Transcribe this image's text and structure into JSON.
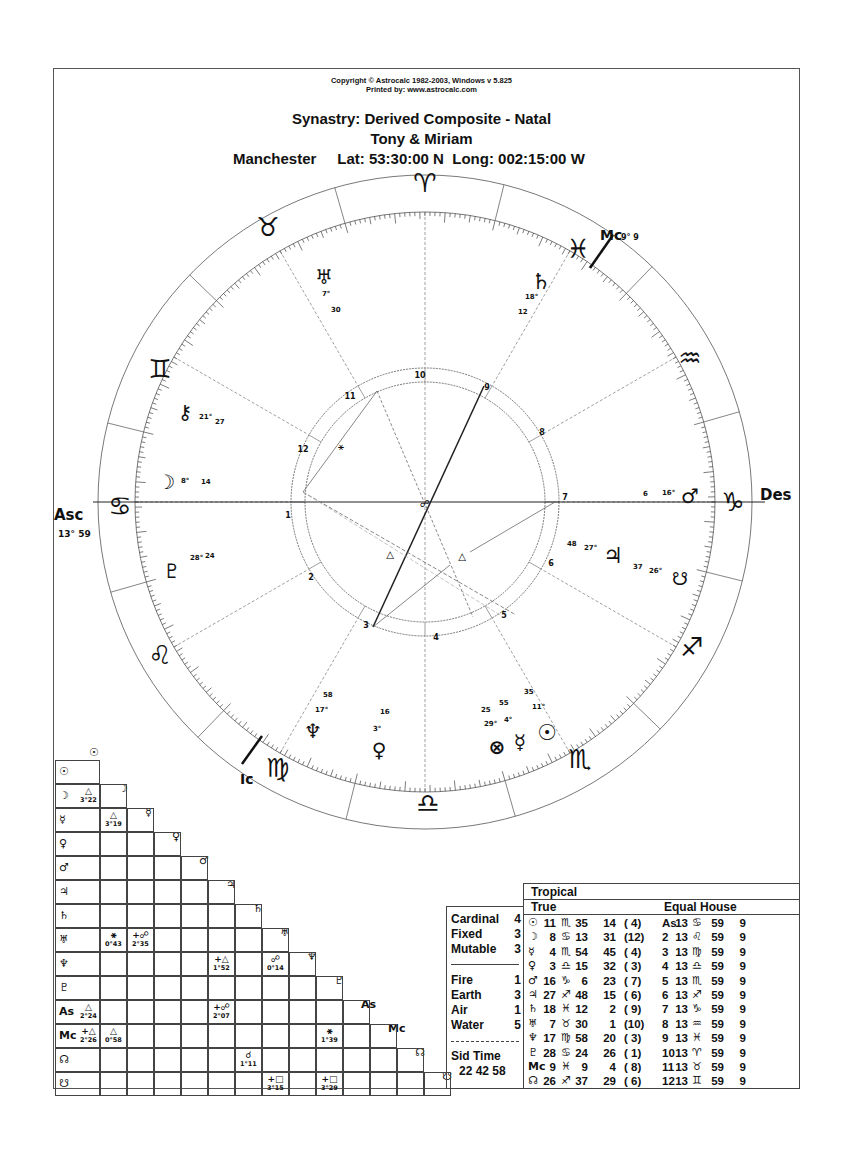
{
  "header": {
    "copyright": "Copyright © Astrocalc 1982-2003, Windows v 5.825",
    "printed_by": "Printed by: www.astrocalc.com",
    "title": "Synastry: Derived Composite - Natal",
    "names": "Tony & Miriam",
    "place": "Manchester",
    "coords": "Lat: 53:30:00 N  Long: 002:15:00 W"
  },
  "wheel": {
    "angles": {
      "asc_label": "Asc",
      "asc_degree": "13° 59",
      "des_label": "Des",
      "mc_label": "Mc",
      "mc_degree": "9° 9",
      "ic_label": "Ic"
    },
    "signs": [
      {
        "name": "Aries",
        "glyph": "♈"
      },
      {
        "name": "Taurus",
        "glyph": "♉"
      },
      {
        "name": "Gemini",
        "glyph": "♊"
      },
      {
        "name": "Cancer",
        "glyph": "♋"
      },
      {
        "name": "Leo",
        "glyph": "♌"
      },
      {
        "name": "Virgo",
        "glyph": "♍"
      },
      {
        "name": "Libra",
        "glyph": "♎"
      },
      {
        "name": "Scorpio",
        "glyph": "♏"
      },
      {
        "name": "Sagittarius",
        "glyph": "♐"
      },
      {
        "name": "Capricorn",
        "glyph": "♑"
      },
      {
        "name": "Aquarius",
        "glyph": "♒"
      },
      {
        "name": "Pisces",
        "glyph": "♓"
      }
    ],
    "house_numbers": [
      "1",
      "2",
      "3",
      "4",
      "5",
      "6",
      "7",
      "8",
      "9",
      "10",
      "11",
      "12"
    ],
    "planets": [
      {
        "name": "Uranus",
        "glyph": "♅",
        "deg": "7°",
        "min": "30"
      },
      {
        "name": "Saturn",
        "glyph": "♄",
        "deg": "18°",
        "min": "12"
      },
      {
        "name": "Chiron",
        "glyph": "⚷",
        "deg": "21°",
        "min": "27"
      },
      {
        "name": "Moon",
        "glyph": "☽",
        "deg": "8°",
        "min": "14"
      },
      {
        "name": "Pluto",
        "glyph": "♇",
        "deg": "28°",
        "min": "24"
      },
      {
        "name": "Mars",
        "glyph": "♂",
        "deg": "16°",
        "min": "6"
      },
      {
        "name": "Jupiter",
        "glyph": "♃",
        "deg": "27°",
        "min": "48"
      },
      {
        "name": "South Node",
        "glyph": "☋",
        "deg": "26°",
        "min": "37"
      },
      {
        "name": "Neptune",
        "glyph": "♆",
        "deg": "17°",
        "min": "58"
      },
      {
        "name": "Venus",
        "glyph": "♀",
        "deg": "3°",
        "min": "16"
      },
      {
        "name": "Part of Fortune",
        "glyph": "⊗",
        "deg": "29°",
        "min": "25"
      },
      {
        "name": "Mercury",
        "glyph": "☿",
        "deg": "4°",
        "min": "55"
      },
      {
        "name": "Sun",
        "glyph": "☉",
        "deg": "11°",
        "min": "35"
      }
    ],
    "aspect_glyphs": {
      "sextile": "⚹",
      "trine": "△",
      "opposition": "☍"
    }
  },
  "aspect_grid": {
    "labels": [
      "☉",
      "☽",
      "☿",
      "♀",
      "♂",
      "♃",
      "♄",
      "♅",
      "♆",
      "♇",
      "As",
      "Mc",
      "☊",
      "☋"
    ],
    "cells": [
      {
        "row": 1,
        "col": 0,
        "glyph": "△",
        "orb": "3°22"
      },
      {
        "row": 2,
        "col": 1,
        "glyph": "△",
        "orb": "3°19"
      },
      {
        "row": 7,
        "col": 1,
        "glyph": "⚹",
        "orb": "0°43"
      },
      {
        "row": 7,
        "col": 2,
        "glyph": "+☍",
        "orb": "2°35"
      },
      {
        "row": 8,
        "col": 5,
        "glyph": "+△",
        "orb": "1°52"
      },
      {
        "row": 8,
        "col": 7,
        "glyph": "☍",
        "orb": "0°14"
      },
      {
        "row": 10,
        "col": 0,
        "glyph": "△",
        "orb": "2°24"
      },
      {
        "row": 10,
        "col": 5,
        "glyph": "+☍",
        "orb": "2°07"
      },
      {
        "row": 11,
        "col": 0,
        "glyph": "+△",
        "orb": "2°26"
      },
      {
        "row": 11,
        "col": 1,
        "glyph": "△",
        "orb": "0°58"
      },
      {
        "row": 11,
        "col": 9,
        "glyph": "⚹",
        "orb": "1°39"
      },
      {
        "row": 12,
        "col": 6,
        "glyph": "☌",
        "orb": "1°11"
      },
      {
        "row": 13,
        "col": 7,
        "glyph": "+□",
        "orb": "3°15"
      },
      {
        "row": 13,
        "col": 9,
        "glyph": "+□",
        "orb": "3°29"
      }
    ]
  },
  "qualities": {
    "modes": [
      {
        "label": "Cardinal",
        "value": "4"
      },
      {
        "label": "Fixed",
        "value": "3"
      },
      {
        "label": "Mutable",
        "value": "3"
      }
    ],
    "elements": [
      {
        "label": "Fire",
        "value": "1"
      },
      {
        "label": "Earth",
        "value": "3"
      },
      {
        "label": "Air",
        "value": "1"
      },
      {
        "label": "Water",
        "value": "5"
      }
    ],
    "sid_time_label": "Sid Time",
    "sid_time_value": "22 42 58"
  },
  "positions": {
    "zodiac": "Tropical",
    "node_type": "True",
    "house_system": "Equal House",
    "rows": [
      {
        "planet": "☉",
        "deg": "11",
        "sign": "♏",
        "min": "35",
        "sec": "14",
        "house": "( 4)",
        "cusp": "As",
        "cdeg": "13",
        "csign": "♋",
        "cmin": "59",
        "csec": "9"
      },
      {
        "planet": "☽",
        "deg": "8",
        "sign": "♋",
        "min": "13",
        "sec": "31",
        "house": "(12)",
        "cusp": "2",
        "cdeg": "13",
        "csign": "♌",
        "cmin": "59",
        "csec": "9"
      },
      {
        "planet": "☿",
        "deg": "4",
        "sign": "♏",
        "min": "54",
        "sec": "45",
        "house": "( 4)",
        "cusp": "3",
        "cdeg": "13",
        "csign": "♍",
        "cmin": "59",
        "csec": "9"
      },
      {
        "planet": "♀",
        "deg": "3",
        "sign": "♎",
        "min": "15",
        "sec": "32",
        "house": "( 3)",
        "cusp": "4",
        "cdeg": "13",
        "csign": "♎",
        "cmin": "59",
        "csec": "9"
      },
      {
        "planet": "♂",
        "deg": "16",
        "sign": "♑",
        "min": "6",
        "sec": "23",
        "house": "( 7)",
        "cusp": "5",
        "cdeg": "13",
        "csign": "♏",
        "cmin": "59",
        "csec": "9"
      },
      {
        "planet": "♃",
        "deg": "27",
        "sign": "♐",
        "min": "48",
        "sec": "15",
        "house": "( 6)",
        "cusp": "6",
        "cdeg": "13",
        "csign": "♐",
        "cmin": "59",
        "csec": "9"
      },
      {
        "planet": "♄",
        "deg": "18",
        "sign": "♓",
        "min": "12",
        "sec": "2",
        "house": "( 9)",
        "cusp": "7",
        "cdeg": "13",
        "csign": "♑",
        "cmin": "59",
        "csec": "9"
      },
      {
        "planet": "♅",
        "deg": "7",
        "sign": "♉",
        "min": "30",
        "sec": "1",
        "house": "(10)",
        "cusp": "8",
        "cdeg": "13",
        "csign": "♒",
        "cmin": "59",
        "csec": "9"
      },
      {
        "planet": "♆",
        "deg": "17",
        "sign": "♍",
        "min": "58",
        "sec": "20",
        "house": "( 3)",
        "cusp": "9",
        "cdeg": "13",
        "csign": "♓",
        "cmin": "59",
        "csec": "9"
      },
      {
        "planet": "♇",
        "deg": "28",
        "sign": "♋",
        "min": "24",
        "sec": "26",
        "house": "( 1)",
        "cusp": "10",
        "cdeg": "13",
        "csign": "♈",
        "cmin": "59",
        "csec": "9"
      },
      {
        "planet": "Mc",
        "deg": "9",
        "sign": "♓",
        "min": "9",
        "sec": "4",
        "house": "( 8)",
        "cusp": "11",
        "cdeg": "13",
        "csign": "♉",
        "cmin": "59",
        "csec": "9"
      },
      {
        "planet": "☊",
        "deg": "26",
        "sign": "♐",
        "min": "37",
        "sec": "29",
        "house": "( 6)",
        "cusp": "12",
        "cdeg": "13",
        "csign": "♊",
        "cmin": "59",
        "csec": "9"
      }
    ]
  }
}
